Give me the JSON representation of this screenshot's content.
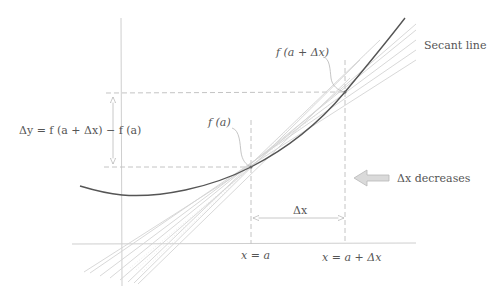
{
  "diagram": {
    "labels": {
      "f_a": "f (a)",
      "f_a_dx": "f (a + Δx)",
      "delta_y": "Δy = f (a + Δx) − f (a)",
      "secant_line": "Secant line",
      "dx_decreases": "Δx decreases",
      "delta_x": "Δx",
      "x_eq_a": "x = a",
      "x_eq_a_dx": "x = a + Δx"
    },
    "colors": {
      "curve": "#555555",
      "axes": "#c8c8c8",
      "dashed": "#bdbdbd",
      "secants": "#d2d2d2",
      "text": "#555555",
      "arrow_fill": "#d8d8d8",
      "arrow_stroke": "#b0b0b0"
    },
    "points": {
      "a": {
        "x": 251,
        "y": 167
      },
      "a_plus_dx": {
        "x": 345,
        "y": 92
      }
    }
  }
}
